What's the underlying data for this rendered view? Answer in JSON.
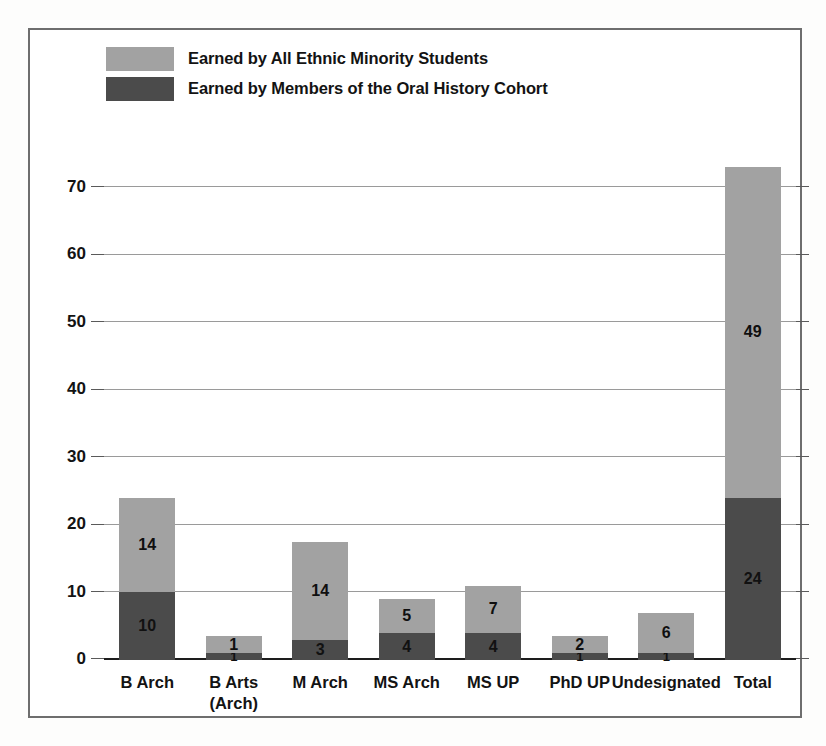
{
  "chart_data": {
    "type": "bar",
    "subtype": "stacked",
    "title": "",
    "xlabel": "",
    "ylabel": "",
    "ylim": [
      0,
      77
    ],
    "yticks": [
      0,
      10,
      20,
      30,
      40,
      50,
      60,
      70
    ],
    "grid": true,
    "legend_position": "top-left",
    "categories": [
      "B Arch",
      "B Arts\n(Arch)",
      "M Arch",
      "MS Arch",
      "MS UP",
      "PhD UP",
      "Undesignated",
      "Total"
    ],
    "category_lines": [
      [
        "B Arch"
      ],
      [
        "B Arts",
        "(Arch)"
      ],
      [
        "M Arch"
      ],
      [
        "MS Arch"
      ],
      [
        "MS UP"
      ],
      [
        "PhD UP"
      ],
      [
        "Undesignated"
      ],
      [
        "Total"
      ]
    ],
    "series": [
      {
        "name": "Earned by Members of the Oral History Cohort",
        "color": "#4b4b4b",
        "values": [
          10,
          1,
          3,
          4,
          4,
          1,
          1,
          24
        ]
      },
      {
        "name": "Earned by All Ethnic Minority Students",
        "color": "#a2a2a2",
        "values": [
          14,
          1,
          14,
          5,
          7,
          2,
          6,
          49
        ]
      }
    ],
    "bar_totals": [
      24,
      3.5,
      17.5,
      9,
      11,
      3.5,
      7,
      73
    ],
    "ytick_labels": [
      "0",
      "10",
      "20",
      "30",
      "40",
      "50",
      "60",
      "70"
    ]
  },
  "legend": {
    "items": [
      {
        "label": "Earned by All Ethnic Minority Students",
        "color": "#a2a2a2"
      },
      {
        "label": "Earned by Members of the Oral History Cohort",
        "color": "#4b4b4b"
      }
    ]
  },
  "colors": {
    "light_gray": "#a2a2a2",
    "dark_gray": "#4b4b4b",
    "frame": "#6e6e6e",
    "gridline": "#9a9a9a",
    "axis": "#1d1d1d",
    "text": "#131313",
    "background": "#ffffff"
  }
}
